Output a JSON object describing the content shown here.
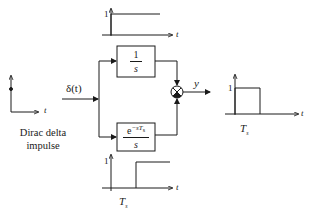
{
  "diagram": {
    "input": {
      "caption_line1": "Dirac delta",
      "caption_line2": "impulse",
      "signal_label": "δ(t)",
      "axis_label": "t"
    },
    "top_plot": {
      "y_tick": "1",
      "axis_label": "t",
      "description": "unit step at t=0"
    },
    "block_integrator": {
      "numerator": "1",
      "denominator": "s"
    },
    "block_delayed_integrator": {
      "numerator_base": "e",
      "numerator_exponent": "−sT",
      "numerator_exponent_sub": "s",
      "denominator": "s"
    },
    "bottom_plot": {
      "y_tick": "1",
      "axis_label": "t",
      "x_tick": "T",
      "x_tick_sub": "s",
      "description": "unit step delayed by Ts"
    },
    "summing_junction": {
      "top_sign": "+",
      "bottom_sign": "−"
    },
    "output": {
      "signal_label": "y"
    },
    "output_plot": {
      "y_tick": "1",
      "axis_label": "t",
      "x_tick": "T",
      "x_tick_sub": "s",
      "description": "rectangular pulse of width Ts"
    },
    "colors": {
      "line": "#1a1a1a",
      "background": "#ffffff"
    }
  }
}
